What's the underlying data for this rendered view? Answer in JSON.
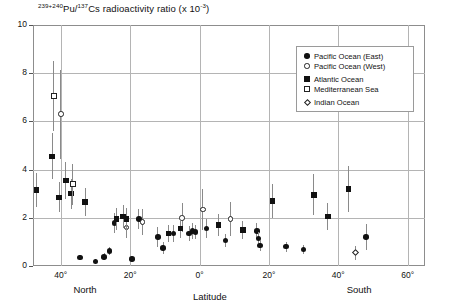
{
  "chart_data": {
    "type": "scatter",
    "title": "239+240Pu/137Cs radioactivity ratio (x 10-3)",
    "title_parts": {
      "sup1": "239+240",
      "mid1": "Pu/",
      "sup2": "137",
      "mid2": "Cs radioactivity ratio (x 10",
      "sup3": "-3",
      "tail": ")"
    },
    "xlabel": "Latitude",
    "ylabel": "",
    "xlim": [
      48,
      -65
    ],
    "ylim": [
      0,
      10
    ],
    "grid": true,
    "legend_position": "top-right",
    "y_ticks": [
      "0",
      "2",
      "4",
      "6",
      "8",
      "10"
    ],
    "y_tick_values": [
      0,
      2,
      4,
      6,
      8,
      10
    ],
    "x_ticks": [
      "40°",
      "20°",
      "0°",
      "20°",
      "40°",
      "60°"
    ],
    "x_tick_values": [
      40,
      20,
      0,
      -20,
      -40,
      -60
    ],
    "hemisphere_labels": [
      {
        "text": "North",
        "lat": 33
      },
      {
        "text": "South",
        "lat": -46
      }
    ],
    "series": [
      {
        "name": "Pacific Ocean (East)",
        "marker": "filled-circle",
        "points": [
          {
            "lat": 34.5,
            "value": 0.35,
            "err": 0.12
          },
          {
            "lat": 30.0,
            "value": 0.18,
            "err": 0.1
          },
          {
            "lat": 27.5,
            "value": 0.38,
            "err": 0.14
          },
          {
            "lat": 26.0,
            "value": 0.62,
            "err": 0.16
          },
          {
            "lat": 24.5,
            "value": 1.78,
            "err": 0.42
          },
          {
            "lat": 19.5,
            "value": 0.3,
            "err": 0.12
          },
          {
            "lat": 17.5,
            "value": 1.95,
            "err": 0.4
          },
          {
            "lat": 12.0,
            "value": 1.2,
            "err": 0.4
          },
          {
            "lat": 10.5,
            "value": 0.75,
            "err": 0.25
          },
          {
            "lat": 7.5,
            "value": 1.35,
            "err": 0.35
          },
          {
            "lat": 3.0,
            "value": 1.35,
            "err": 0.3
          },
          {
            "lat": 2.0,
            "value": 1.45,
            "err": 0.35
          },
          {
            "lat": 1.2,
            "value": 1.42,
            "err": 0.3
          },
          {
            "lat": -2.0,
            "value": 1.55,
            "err": 0.4
          },
          {
            "lat": -7.5,
            "value": 1.05,
            "err": 0.28
          },
          {
            "lat": -16.5,
            "value": 1.45,
            "err": 0.32
          },
          {
            "lat": -17.0,
            "value": 1.15,
            "err": 0.28
          },
          {
            "lat": -17.5,
            "value": 0.85,
            "err": 0.22
          },
          {
            "lat": -25.0,
            "value": 0.8,
            "err": 0.2
          },
          {
            "lat": -30.0,
            "value": 0.68,
            "err": 0.18
          },
          {
            "lat": -48.0,
            "value": 1.2,
            "err": 0.55
          }
        ]
      },
      {
        "name": "Pacific Ocean (West)",
        "marker": "open-circle",
        "points": [
          {
            "lat": 40.0,
            "value": 6.3,
            "err": 1.85
          },
          {
            "lat": 21.0,
            "value": 1.6,
            "err": 0.45
          },
          {
            "lat": 16.5,
            "value": 1.82,
            "err": 0.55
          },
          {
            "lat": 5.0,
            "value": 2.0,
            "err": 0.6
          },
          {
            "lat": -1.0,
            "value": 2.35,
            "err": 0.85
          },
          {
            "lat": -9.0,
            "value": 1.95,
            "err": 0.7
          }
        ]
      },
      {
        "name": "Atlantic Ocean",
        "marker": "filled-square",
        "points": [
          {
            "lat": 47.0,
            "value": 3.15,
            "err": 0.7
          },
          {
            "lat": 42.5,
            "value": 4.55,
            "err": 0.95
          },
          {
            "lat": 40.5,
            "value": 2.85,
            "err": 0.62
          },
          {
            "lat": 38.5,
            "value": 3.55,
            "err": 0.75
          },
          {
            "lat": 37.0,
            "value": 3.0,
            "err": 0.62
          },
          {
            "lat": 33.0,
            "value": 2.65,
            "err": 0.58
          },
          {
            "lat": 24.0,
            "value": 1.95,
            "err": 0.45
          },
          {
            "lat": 22.0,
            "value": 2.05,
            "err": 0.48
          },
          {
            "lat": 21.0,
            "value": 1.95,
            "err": 0.45
          },
          {
            "lat": 9.0,
            "value": 1.35,
            "err": 0.35
          },
          {
            "lat": 5.5,
            "value": 1.55,
            "err": 0.38
          },
          {
            "lat": -5.5,
            "value": 1.7,
            "err": 0.45
          },
          {
            "lat": -12.5,
            "value": 1.5,
            "err": 0.38
          },
          {
            "lat": -21.0,
            "value": 2.7,
            "err": 0.72
          },
          {
            "lat": -33.0,
            "value": 2.95,
            "err": 0.85
          },
          {
            "lat": -37.0,
            "value": 2.05,
            "err": 0.55
          },
          {
            "lat": -43.0,
            "value": 3.2,
            "err": 0.95
          }
        ]
      },
      {
        "name": "Mediterranean Sea",
        "marker": "open-square",
        "points": [
          {
            "lat": 42.0,
            "value": 7.05,
            "err": 1.45
          },
          {
            "lat": 36.5,
            "value": 3.4,
            "err": 0.85
          }
        ]
      },
      {
        "name": "Indian Ocean",
        "marker": "open-diamond",
        "points": [
          {
            "lat": -45.0,
            "value": 0.55,
            "err": 0.3
          }
        ]
      }
    ]
  }
}
